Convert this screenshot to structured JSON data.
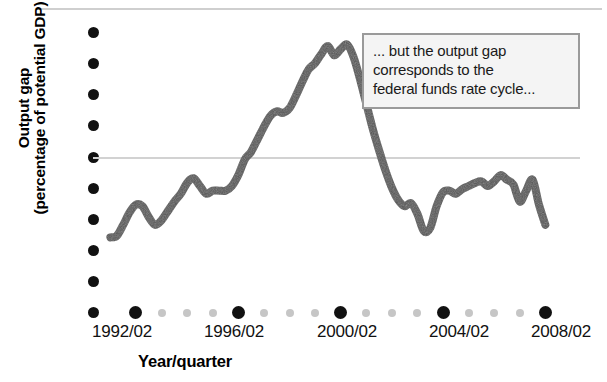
{
  "chart_data": {
    "type": "line",
    "title": "",
    "subtitle": "",
    "xlabel": "Year/quarter",
    "ylabel": "Output gap (percentage of potential GDP)",
    "ylabel_lines": [
      "Output gap",
      "(percentage of potential GDP)"
    ],
    "yticks": [
      4,
      3,
      2,
      1,
      0,
      -1,
      -2,
      -3,
      -4,
      -5
    ],
    "ytick_labels": [
      "4",
      "3",
      "2",
      "1",
      "0",
      "–1",
      "–2",
      "–3",
      "–4",
      "–5"
    ],
    "ylim": [
      -5,
      4
    ],
    "xtick_labels": [
      "1992/02",
      "1996/02",
      "2000/02",
      "2004/02",
      "2008/02"
    ],
    "xtick_values": [
      1992.25,
      1996.25,
      2000.25,
      2004.25,
      2008.25
    ],
    "xlim": [
      1991.0,
      2008.9
    ],
    "minor_ticks_between_majors": 3,
    "grid": false,
    "zero_line": true,
    "legend": "none",
    "line_color": "#555555",
    "line_width_px": 8,
    "series": [
      {
        "name": "Output gap",
        "x": [
          1991.25,
          1991.5,
          1991.75,
          1992.0,
          1992.25,
          1992.5,
          1992.75,
          1993.0,
          1993.25,
          1993.5,
          1993.75,
          1994.0,
          1994.25,
          1994.5,
          1994.75,
          1995.0,
          1995.25,
          1995.5,
          1995.75,
          1996.0,
          1996.25,
          1996.5,
          1996.75,
          1997.0,
          1997.25,
          1997.5,
          1997.75,
          1998.0,
          1998.25,
          1998.5,
          1998.75,
          1999.0,
          1999.25,
          1999.5,
          1999.75,
          2000.0,
          2000.25,
          2000.5,
          2000.75,
          2001.0,
          2001.25,
          2001.5,
          2001.75,
          2002.0,
          2002.25,
          2002.5,
          2002.75,
          2003.0,
          2003.25,
          2003.5,
          2003.75,
          2004.0,
          2004.25,
          2004.5,
          2004.75,
          2005.0,
          2005.25,
          2005.5,
          2005.75,
          2006.0,
          2006.25,
          2006.5,
          2006.75,
          2007.0,
          2007.25,
          2007.5,
          2007.75,
          2008.0,
          2008.25
        ],
        "y": [
          -2.6,
          -2.55,
          -2.2,
          -1.8,
          -1.55,
          -1.6,
          -1.95,
          -2.2,
          -2.05,
          -1.75,
          -1.45,
          -1.2,
          -0.85,
          -0.7,
          -0.95,
          -1.2,
          -1.1,
          -1.1,
          -1.1,
          -0.95,
          -0.6,
          -0.1,
          0.15,
          0.55,
          0.95,
          1.3,
          1.45,
          1.4,
          1.55,
          1.95,
          2.4,
          2.8,
          3.0,
          3.3,
          3.55,
          3.25,
          3.45,
          3.6,
          3.2,
          2.5,
          1.7,
          0.9,
          0.2,
          -0.45,
          -1.0,
          -1.4,
          -1.6,
          -1.5,
          -1.85,
          -2.4,
          -2.3,
          -1.6,
          -1.15,
          -1.1,
          -1.2,
          -1.05,
          -0.95,
          -0.85,
          -0.8,
          -0.95,
          -0.8,
          -0.6,
          -0.75,
          -0.9,
          -1.45,
          -1.1,
          -0.75,
          -1.55,
          -2.2
        ]
      }
    ],
    "annotation": {
      "lines": [
        "... but the output gap",
        "corresponds to the",
        "federal funds rate cycle..."
      ],
      "border_color": "#9a9a9a",
      "background_color": "#f4f4f4"
    }
  },
  "axis": {
    "ylabel_line1": "Output gap",
    "ylabel_line2": "(percentage of potential GDP)",
    "xtitle": "Year/quarter"
  },
  "yticks": [
    {
      "label": "4"
    },
    {
      "label": "3"
    },
    {
      "label": "2"
    },
    {
      "label": "1"
    },
    {
      "label": "0"
    },
    {
      "label": "–1"
    },
    {
      "label": "–2"
    },
    {
      "label": "–3"
    },
    {
      "label": "–4"
    },
    {
      "label": "–5"
    }
  ],
  "xticks": [
    {
      "label": "1992/02"
    },
    {
      "label": "1996/02"
    },
    {
      "label": "2000/02"
    },
    {
      "label": "2004/02"
    },
    {
      "label": "2008/02"
    }
  ],
  "callout": {
    "line1": "... but the output gap",
    "line2": "corresponds to the",
    "line3": "federal funds rate cycle..."
  }
}
